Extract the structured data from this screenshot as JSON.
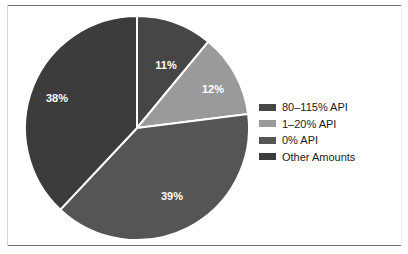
{
  "figure": {
    "background_color": "#ffffff",
    "frame_color": "#6e6e6e"
  },
  "chart_data": {
    "type": "pie",
    "title": "",
    "subtitle": "",
    "xlabel": "",
    "ylabel": "",
    "grid": false,
    "legend_position": "right",
    "start_angle_deg": 0,
    "direction": "clockwise",
    "center": {
      "x": 137,
      "y": 128
    },
    "radius": 112,
    "slice_separator_color": "#ffffff",
    "label_color": "#ffffff",
    "categories": [
      "80–115% API",
      "1–20% API",
      "0% API",
      "Other Amounts"
    ],
    "values": [
      11,
      12,
      39,
      38
    ],
    "value_labels": [
      "11%",
      "12%",
      "39%",
      "38%"
    ],
    "colors": [
      "#464646",
      "#9a9a9a",
      "#555555",
      "#3c3c3c"
    ],
    "slices": [
      {
        "label": "80–115% API",
        "value": 11,
        "value_label": "11%",
        "color": "#464646",
        "label_position": {
          "x": 166,
          "y": 66
        }
      },
      {
        "label": "1–20% API",
        "value": 12,
        "value_label": "12%",
        "color": "#9a9a9a",
        "label_position": {
          "x": 213,
          "y": 90
        }
      },
      {
        "label": "0% API",
        "value": 39,
        "value_label": "39%",
        "color": "#555555",
        "label_position": {
          "x": 172,
          "y": 197
        }
      },
      {
        "label": "Other Amounts",
        "value": 38,
        "value_label": "38%",
        "color": "#3c3c3c",
        "label_position": {
          "x": 57,
          "y": 99
        }
      }
    ]
  },
  "legend": {
    "items": [
      {
        "label": "80–115% API",
        "color": "#464646"
      },
      {
        "label": "1–20% API",
        "color": "#9a9a9a"
      },
      {
        "label": "0% API",
        "color": "#555555"
      },
      {
        "label": "Other Amounts",
        "color": "#3c3c3c"
      }
    ]
  }
}
